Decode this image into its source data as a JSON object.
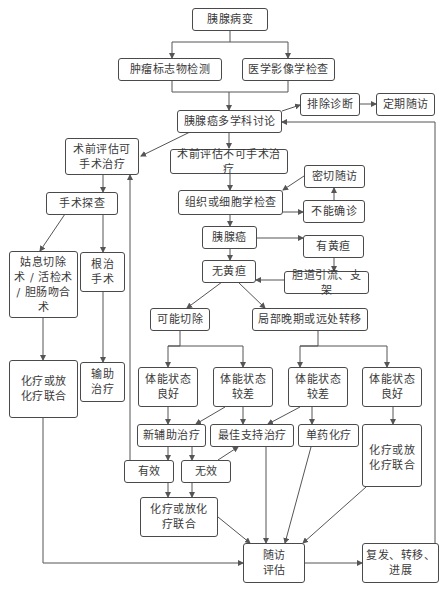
{
  "diagram": {
    "type": "flowchart",
    "nodes": {
      "pancreatic_lesion": "胰腺病变",
      "tumor_markers": "肿瘤标志物检测",
      "medical_imaging": "医学影像学检查",
      "mdt_discussion": "胰腺癌多学科讨论",
      "excluded_diagnosis": "排除诊断",
      "regular_followup": "定期随访",
      "resectable": "术前评估可\n手术治疗",
      "unresectable": "术前评估不可手术治疗",
      "surgical_exploration": "手术探查",
      "close_followup": "密切随访",
      "histology_cytology": "组织或细胞学检查",
      "undiagnosed": "不能确诊",
      "pancreatic_cancer": "胰腺癌",
      "with_jaundice": "有黄疸",
      "no_jaundice": "无黄疸",
      "biliary_drainage": "胆道引流、支架",
      "palliative_surgery": "姑息切除\n术 / 活检术\n/ 胆肠吻合\n术",
      "radical_surgery": "根治\n手术",
      "possibly_resectable": "可能切除",
      "locally_advanced_metastatic": "局部晚期或远处转移",
      "chemo_left": "化疗或放\n化疗联合",
      "adjuvant_therapy": "输助\n治疗",
      "ps_good_1": "体能状态\n良好",
      "ps_poor_1": "体能状态\n较差",
      "ps_poor_2": "体能状态\n较差",
      "ps_good_2": "体能状态\n良好",
      "neoadjuvant": "新辅助治疗",
      "best_supportive": "最佳支持治疗",
      "single_agent_chemo": "单药化疗",
      "chemo_right": "化疗或放\n化疗联合",
      "effective": "有效",
      "ineffective": "无效",
      "chemo_mid": "化疗或放化\n疗联合",
      "followup_eval": "随访\n评估",
      "recurrence": "复发、转移、\n进展"
    }
  }
}
